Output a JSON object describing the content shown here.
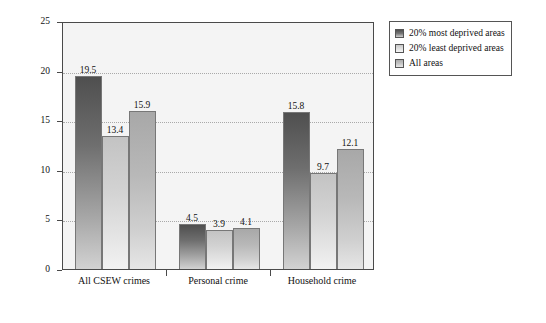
{
  "chart_data": {
    "type": "bar",
    "title": "",
    "xlabel": "",
    "ylabel": "Percentage victims once or more",
    "ylim": [
      0,
      25
    ],
    "yticks": [
      "0",
      "5",
      "10",
      "15",
      "20",
      "25"
    ],
    "grid": "horizontal-dotted",
    "legend_position": "outside-right-top",
    "categories": [
      "All CSEW crimes",
      "Personal crime",
      "Household crime"
    ],
    "series": [
      {
        "name": "20% most deprived areas",
        "values": [
          19.5,
          4.5,
          15.8
        ],
        "labels": [
          "19.5",
          "4.5",
          "15.8"
        ],
        "color": "#5a5a5a"
      },
      {
        "name": "20% least deprived areas",
        "values": [
          13.4,
          3.9,
          9.7
        ],
        "labels": [
          "13.4",
          "3.9",
          "9.7"
        ],
        "color": "#d8d8d8"
      },
      {
        "name": "All areas",
        "values": [
          15.9,
          4.1,
          12.1
        ],
        "labels": [
          "15.9",
          "4.1",
          "12.1"
        ],
        "color": "#bcbcbc"
      }
    ]
  },
  "legend": {
    "items": [
      {
        "label": "20% most deprived areas"
      },
      {
        "label": "20% least deprived areas"
      },
      {
        "label": "All areas"
      }
    ]
  }
}
